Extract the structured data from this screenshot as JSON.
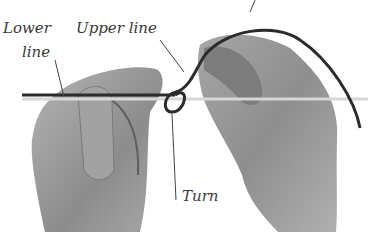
{
  "figure": {
    "colors": {
      "background": "#ffffff",
      "skin": "#9a9a9a",
      "skin_dark": "#6e6e6e",
      "line_dark": "#2b2b2b",
      "line_light": "#d8d8d8",
      "leader": "#444444",
      "text": "#3a3a3a"
    }
  },
  "labels": {
    "lower_line_1": "Lower",
    "lower_line_2": "line",
    "upper_line": "Upper line",
    "turn": "Turn"
  }
}
